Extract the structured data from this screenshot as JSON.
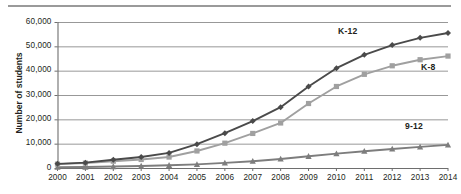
{
  "chart_data": {
    "type": "line",
    "title": "",
    "xlabel": "",
    "ylabel": "Number of students",
    "x": [
      2000,
      2001,
      2002,
      2003,
      2004,
      2005,
      2006,
      2007,
      2008,
      2009,
      2010,
      2011,
      2012,
      2013,
      2014
    ],
    "categories": [
      "2000",
      "2001",
      "2002",
      "2003",
      "2004",
      "2005",
      "2006",
      "2007",
      "2008",
      "2009",
      "2010",
      "2011",
      "2012",
      "2013",
      "2014"
    ],
    "ylim": [
      0,
      60000
    ],
    "yticks": [
      0,
      10000,
      20000,
      30000,
      40000,
      50000,
      60000
    ],
    "ytick_labels": [
      "0",
      "10,000",
      "20,000",
      "30,000",
      "40,000",
      "50,000",
      "60,000"
    ],
    "grid": "horizontal",
    "legend": "inline-labels",
    "series": [
      {
        "name": "K-12",
        "label": "K-12",
        "color": "#4a4a4a",
        "marker": "diamond",
        "values": [
          1700,
          2200,
          3400,
          4500,
          6200,
          9800,
          14300,
          19300,
          25000,
          33500,
          41000,
          46500,
          50500,
          53500,
          55500
        ]
      },
      {
        "name": "K-8",
        "label": "K-8",
        "color": "#a0a0a0",
        "marker": "square",
        "values": [
          1600,
          2000,
          2800,
          3500,
          4500,
          7000,
          10200,
          14200,
          18500,
          26500,
          33500,
          38500,
          42000,
          44500,
          46000
        ]
      },
      {
        "name": "9-12",
        "label": "9-12",
        "color": "#7d7d7d",
        "marker": "triangle",
        "values": [
          300,
          400,
          600,
          800,
          1100,
          1500,
          2100,
          2800,
          3700,
          4800,
          5900,
          6900,
          7800,
          8700,
          9500
        ]
      }
    ]
  },
  "axis": {
    "y_title": "Number of students"
  },
  "colors": {
    "k12": "#4a4a4a",
    "k8": "#a0a0a0",
    "g912": "#7d7d7d",
    "grid": "#8c8c8c",
    "axis": "#6e6e6e",
    "rule": "#9a9a9a",
    "text": "#231f20"
  }
}
